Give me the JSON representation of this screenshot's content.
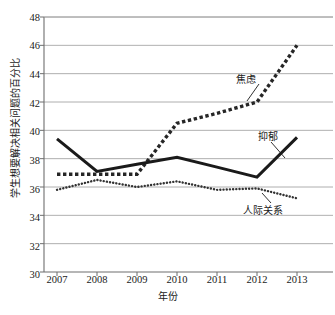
{
  "chart_data": {
    "type": "line",
    "title": "",
    "xlabel": "年份",
    "ylabel": "学生想要解决相关问题的百分比",
    "categories": [
      "2007",
      "2008",
      "2009",
      "2010",
      "2011",
      "2012",
      "2013"
    ],
    "x": [
      2007,
      2008,
      2009,
      2010,
      2011,
      2012,
      2013
    ],
    "ylim": [
      30,
      48
    ],
    "ytick_step": 2,
    "yticks": [
      "48",
      "46",
      "44",
      "42",
      "40",
      "38",
      "36",
      "34",
      "32",
      "30"
    ],
    "grid": "horizontal",
    "legend": "annotations-inline",
    "series": [
      {
        "name": "焦虑",
        "style": "thick-square-dotted",
        "color": "#262626",
        "values": [
          36.9,
          36.9,
          36.9,
          40.5,
          41.2,
          42.0,
          46.0
        ]
      },
      {
        "name": "抑郁",
        "style": "thick-solid",
        "color": "#1a1a1a",
        "values": [
          39.4,
          37.1,
          37.6,
          38.1,
          37.4,
          36.7,
          39.5
        ]
      },
      {
        "name": "人际关系",
        "style": "fine-round-dotted",
        "color": "#333333",
        "values": [
          35.8,
          36.5,
          36.0,
          36.4,
          35.8,
          35.9,
          35.2
        ]
      }
    ],
    "annotations": [
      {
        "text": "焦虑",
        "series": "焦虑"
      },
      {
        "text": "抑郁",
        "series": "抑郁"
      },
      {
        "text": "人际关系",
        "series": "人际关系"
      }
    ]
  },
  "axis": {
    "y_title": "学生想要解决相关问题的百分比",
    "x_title": "年份"
  },
  "labels": {
    "anxiety": "焦虑",
    "depression": "抑郁",
    "relation": "人际关系"
  }
}
